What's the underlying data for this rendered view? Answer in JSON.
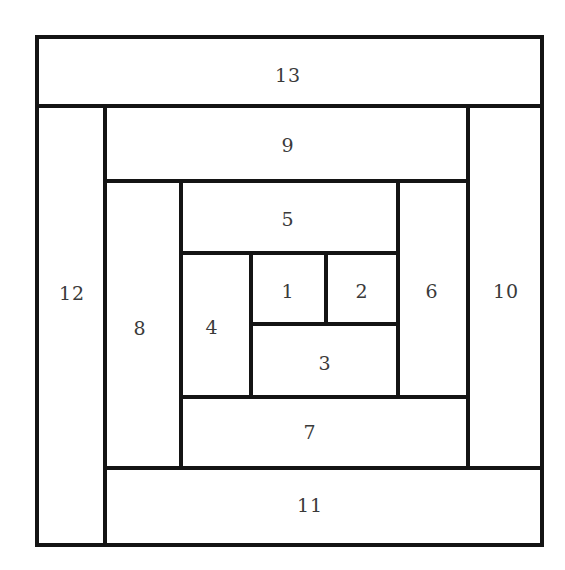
{
  "diagram": {
    "line_color": "#141414",
    "label_color": "#3a3a3a",
    "background": "#ffffff",
    "pieces": [
      {
        "id": "1",
        "label": "1",
        "x": 251,
        "y": 253,
        "w": 75,
        "h": 71,
        "cx": 288,
        "cy": 290
      },
      {
        "id": "2",
        "label": "2",
        "x": 326,
        "y": 253,
        "w": 72,
        "h": 71,
        "cx": 362,
        "cy": 290
      },
      {
        "id": "3",
        "label": "3",
        "x": 251,
        "y": 324,
        "w": 147,
        "h": 73,
        "cx": 325,
        "cy": 362
      },
      {
        "id": "4",
        "label": "4",
        "x": 181,
        "y": 253,
        "w": 70,
        "h": 144,
        "cx": 212,
        "cy": 326
      },
      {
        "id": "5",
        "label": "5",
        "x": 181,
        "y": 181,
        "w": 217,
        "h": 72,
        "cx": 288,
        "cy": 219
      },
      {
        "id": "6",
        "label": "6",
        "x": 398,
        "y": 181,
        "w": 70,
        "h": 216,
        "cx": 432,
        "cy": 290
      },
      {
        "id": "7",
        "label": "7",
        "x": 181,
        "y": 397,
        "w": 287,
        "h": 71,
        "cx": 310,
        "cy": 432
      },
      {
        "id": "8",
        "label": "8",
        "x": 107,
        "y": 181,
        "w": 74,
        "h": 287,
        "cx": 140,
        "cy": 327
      },
      {
        "id": "9",
        "label": "9",
        "x": 107,
        "y": 106,
        "w": 361,
        "h": 75,
        "cx": 288,
        "cy": 145
      },
      {
        "id": "10",
        "label": "10",
        "x": 468,
        "y": 106,
        "w": 73,
        "h": 362,
        "cx": 506,
        "cy": 290
      },
      {
        "id": "11",
        "label": "11",
        "x": 107,
        "y": 468,
        "w": 434,
        "h": 76,
        "cx": 310,
        "cy": 505
      },
      {
        "id": "12",
        "label": "12",
        "x": 37,
        "y": 106,
        "w": 70,
        "h": 438,
        "cx": 72,
        "cy": 293
      },
      {
        "id": "13",
        "label": "13",
        "x": 37,
        "y": 37,
        "w": 504,
        "h": 69,
        "cx": 288,
        "cy": 75
      }
    ]
  },
  "labels": {
    "p1": "1",
    "p2": "2",
    "p3": "3",
    "p4": "4",
    "p5": "5",
    "p6": "6",
    "p7": "7",
    "p8": "8",
    "p9": "9",
    "p10": "10",
    "p11": "11",
    "p12": "12",
    "p13": "13"
  }
}
